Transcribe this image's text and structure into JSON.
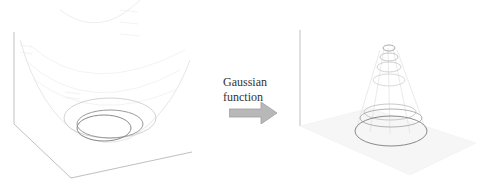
{
  "diagram": {
    "left_panel": {
      "description": "3D paraboloid surface (bowl) with contour ellipses at the bottom"
    },
    "transform": {
      "label_line1": "Gaussian",
      "label_line2": "function",
      "arrow_color": "#b0b0b0"
    },
    "right_panel": {
      "description": "3D Gaussian peak surface (cone-like) with contour ellipses"
    },
    "colors": {
      "wire": "#d8d8d8",
      "contour": "#8a8a8a",
      "axis": "#b8b8b8"
    }
  }
}
